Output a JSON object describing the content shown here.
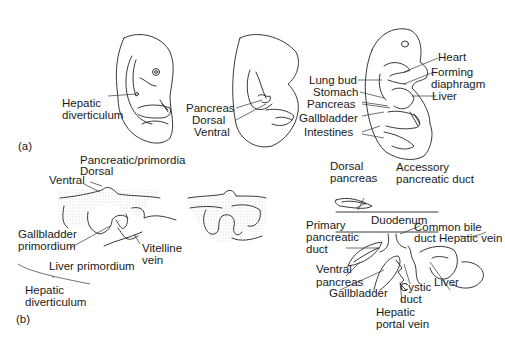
{
  "panels": {
    "a": {
      "tag": "(a)",
      "embryo1": {
        "labels": [
          "Hepatic",
          "diverticulum"
        ]
      },
      "embryo2": {
        "labels": [
          "Pancreas",
          "Dorsal",
          "Ventral"
        ]
      },
      "embryo3": {
        "left_labels": [
          "Lung bud",
          "Stomach",
          "Pancreas",
          "Gallbladder",
          "Intestines"
        ],
        "right_labels": [
          "Heart",
          "Forming",
          "diaphragm",
          "Liver"
        ]
      }
    },
    "b": {
      "tag": "(b)",
      "left": {
        "pancreatic": "Pancreatic/primordia",
        "dorsal": "Dorsal",
        "ventral": "Ventral",
        "gallbladder_1": "Gallbladder",
        "gallbladder_2": "primordium",
        "liver_primordium": "Liver primordium",
        "vitelline_1": "Vitelline",
        "vitelline_2": "vein",
        "hepatic_1": "Hepatic",
        "hepatic_2": "diverticulum"
      },
      "right": {
        "dorsal_pancreas_1": "Dorsal",
        "dorsal_pancreas_2": "pancreas",
        "accessory_1": "Accessory",
        "accessory_2": "pancreatic duct",
        "duodenum": "Duodenum",
        "primary_1": "Primary",
        "primary_2": "pancreatic",
        "primary_3": "duct",
        "common_bile_1": "Common bile",
        "common_bile_2": "duct",
        "hepatic_vein": "Hepatic vein",
        "ventral_1": "Ventral",
        "ventral_2": "pancreas",
        "gallbladder": "Gallbladder",
        "cystic_1": "Cystic",
        "cystic_2": "duct",
        "liver": "Liver",
        "portal_1": "Hepatic",
        "portal_2": "portal vein"
      }
    }
  }
}
